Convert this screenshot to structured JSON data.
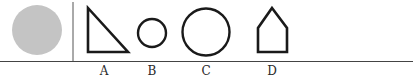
{
  "diagram": {
    "given_figure": {
      "shape": "filled-circle",
      "fill": "#c4c4c4"
    },
    "options": [
      {
        "label": "A",
        "shape": "right-triangle"
      },
      {
        "label": "B",
        "shape": "small-circle"
      },
      {
        "label": "C",
        "shape": "large-circle"
      },
      {
        "label": "D",
        "shape": "house-pentagon"
      }
    ],
    "colors": {
      "stroke": "#1a1a1a",
      "rule": "#333333",
      "filled": "#c4c4c4"
    }
  }
}
